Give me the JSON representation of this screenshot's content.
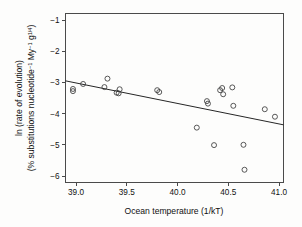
{
  "chart_data": {
    "type": "scatter",
    "title": "",
    "xlabel": "Ocean temperature (1/kT)",
    "ylabel_line1": "ln (rate of evolution)",
    "ylabel_line2_prefix": "(% substitutions nucleotide",
    "ylabel_line2_sup1": "−1",
    "ylabel_line2_mid": " My",
    "ylabel_line2_sup2": "−1",
    "ylabel_line2_mid2": " g",
    "ylabel_line2_sup3": "1/4",
    "ylabel_line2_suffix": ")",
    "xlim": [
      38.85,
      41.05
    ],
    "ylim": [
      -6.4,
      -0.75
    ],
    "xticks": [
      "39.0",
      "39.5",
      "40.0",
      "40.5",
      "41.0"
    ],
    "xtick_values": [
      39.0,
      39.5,
      40.0,
      40.5,
      41.0
    ],
    "yticks": [
      "−1",
      "−2",
      "−3",
      "−4",
      "−5",
      "−6"
    ],
    "ytick_values": [
      -1,
      -2,
      -3,
      -4,
      -5,
      -6
    ],
    "grid": false,
    "legend": "none",
    "marker": "open-circle",
    "marker_color": "#3b3b3b",
    "line_color": "#262626",
    "points": [
      {
        "x": 38.97,
        "y": -3.21
      },
      {
        "x": 38.97,
        "y": -3.28
      },
      {
        "x": 39.07,
        "y": -3.05
      },
      {
        "x": 39.28,
        "y": -3.15
      },
      {
        "x": 39.31,
        "y": -2.88
      },
      {
        "x": 39.4,
        "y": -3.33
      },
      {
        "x": 39.42,
        "y": -3.35
      },
      {
        "x": 39.43,
        "y": -3.22
      },
      {
        "x": 39.8,
        "y": -3.25
      },
      {
        "x": 39.82,
        "y": -3.31
      },
      {
        "x": 40.19,
        "y": -4.45
      },
      {
        "x": 40.29,
        "y": -3.6
      },
      {
        "x": 40.3,
        "y": -3.68
      },
      {
        "x": 40.36,
        "y": -5.01
      },
      {
        "x": 40.42,
        "y": -3.25
      },
      {
        "x": 40.44,
        "y": -3.18
      },
      {
        "x": 40.45,
        "y": -3.38
      },
      {
        "x": 40.54,
        "y": -3.16
      },
      {
        "x": 40.55,
        "y": -3.75
      },
      {
        "x": 40.65,
        "y": -5.0
      },
      {
        "x": 40.66,
        "y": -5.8
      },
      {
        "x": 40.86,
        "y": -3.86
      },
      {
        "x": 40.96,
        "y": -4.1
      }
    ],
    "fit_line": {
      "x0": 38.85,
      "y0": -2.95,
      "x1": 41.05,
      "y1": -4.36
    }
  }
}
